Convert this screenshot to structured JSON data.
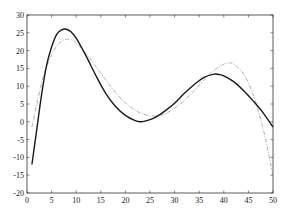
{
  "chart_data": {
    "type": "line",
    "title": "",
    "xlabel": "",
    "ylabel": "",
    "xlim": [
      0,
      50
    ],
    "ylim": [
      -20,
      30
    ],
    "grid": false,
    "legend": null,
    "x_ticks": [
      0,
      5,
      10,
      15,
      20,
      25,
      30,
      35,
      40,
      45,
      50
    ],
    "y_ticks": [
      -20,
      -15,
      -10,
      -5,
      0,
      5,
      10,
      15,
      20,
      25,
      30
    ],
    "series": [
      {
        "name": "dark-curve",
        "color": "#1a1a1a",
        "width": 1.4,
        "dash": "",
        "x": [
          1,
          2,
          3,
          4,
          5,
          6,
          7,
          8,
          9,
          10,
          12,
          14,
          16,
          18,
          20,
          22,
          23,
          24,
          26,
          28,
          30,
          32,
          34,
          36,
          38,
          39,
          40,
          42,
          44,
          46,
          48,
          50
        ],
        "y": [
          -12,
          -2,
          8,
          16,
          21,
          24.5,
          25.8,
          26,
          25.2,
          23.5,
          18.5,
          13,
          8,
          4.3,
          1.8,
          0.3,
          0,
          0.2,
          1.2,
          3,
          5.2,
          8,
          10.5,
          12.5,
          13.4,
          13.3,
          12.9,
          11.3,
          8.8,
          5.8,
          2.5,
          -1.5
        ]
      },
      {
        "name": "light-dashdot-curve",
        "color": "#9a9a9a",
        "width": 0.8,
        "dash": "4,1.5,1,1.5",
        "x": [
          1,
          2,
          3,
          4,
          5,
          6,
          7,
          8,
          9,
          10,
          12,
          14,
          16,
          18,
          20,
          22,
          24,
          26,
          28,
          30,
          32,
          34,
          36,
          38,
          40,
          41,
          42,
          44,
          46,
          48,
          50
        ],
        "y": [
          -1.5,
          5,
          11,
          15.5,
          18.8,
          21.2,
          22.6,
          23.2,
          23,
          22.2,
          19.2,
          15.5,
          11.8,
          8.2,
          5.3,
          3.2,
          2,
          1.6,
          2.2,
          3.8,
          6,
          8.8,
          11.8,
          14.5,
          16.2,
          16.5,
          16.2,
          13.5,
          7.5,
          -2,
          -15
        ]
      }
    ]
  },
  "plot_area": {
    "left": 27,
    "top": 15,
    "right": 273,
    "bottom": 193
  }
}
